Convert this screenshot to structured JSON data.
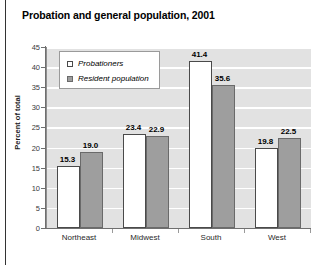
{
  "chart_data": {
    "type": "bar",
    "title": "Probation and general population, 2001",
    "xlabel": "",
    "ylabel": "Percent of total",
    "categories": [
      "Northeast",
      "Midwest",
      "South",
      "West"
    ],
    "series": [
      {
        "name": "Probationers",
        "swatch": "white",
        "values": [
          15.3,
          23.4,
          41.4,
          19.8
        ],
        "labels": [
          "15.3",
          "23.4",
          "41.4",
          "19.8"
        ]
      },
      {
        "name": "Resident population",
        "swatch": "gray",
        "values": [
          19.0,
          22.9,
          35.6,
          22.5
        ],
        "labels": [
          "19.0",
          "22.9",
          "35.6",
          "22.5"
        ]
      }
    ],
    "ylim": [
      0,
      45
    ],
    "yticks": [
      0,
      5,
      10,
      15,
      20,
      25,
      30,
      35,
      40,
      45
    ],
    "ytick_labels": [
      "0",
      "5",
      "10",
      "15",
      "20",
      "25",
      "30",
      "35",
      "40",
      "45"
    ],
    "grid": true,
    "legend_position": "upper-left-inside",
    "colors": {
      "probationers_fill": "#ffffff",
      "probationers_edge": "#4a4a4a",
      "resident_fill": "#9e9e9e",
      "resident_edge": "#6a6a6a",
      "plot_background": "#e2e2e2",
      "gridline": "#ffffff",
      "axis": "#6f6f6f",
      "text": "#000000"
    }
  }
}
